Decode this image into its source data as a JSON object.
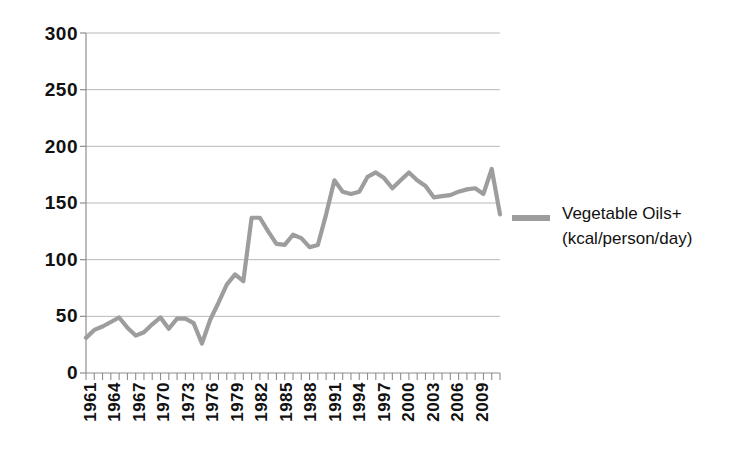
{
  "chart_data": {
    "type": "line",
    "title": "",
    "subtitle": "",
    "xlabel": "",
    "ylabel": "",
    "grid": true,
    "legend_position": "right",
    "xlim": [
      1961,
      2011
    ],
    "ylim": [
      0,
      300
    ],
    "y_ticks": [
      0,
      50,
      100,
      150,
      200,
      250,
      300
    ],
    "y_tick_labels": [
      "0",
      "50",
      "100",
      "150",
      "200",
      "250",
      "300"
    ],
    "x_tick_labels": [
      "1961",
      "1964",
      "1967",
      "1970",
      "1973",
      "1976",
      "1979",
      "1982",
      "1985",
      "1988",
      "1991",
      "1994",
      "1997",
      "2000",
      "2003",
      "2006",
      "2009"
    ],
    "x_tick_step": 3,
    "minor_x_ticks_every_year": true,
    "series": [
      {
        "name": "Vegetable Oils+ (kcal/person/day)",
        "color": "#9d9d9d",
        "x": [
          1961,
          1962,
          1963,
          1964,
          1965,
          1966,
          1967,
          1968,
          1969,
          1970,
          1971,
          1972,
          1973,
          1974,
          1975,
          1976,
          1977,
          1978,
          1979,
          1980,
          1981,
          1982,
          1983,
          1984,
          1985,
          1986,
          1987,
          1988,
          1989,
          1990,
          1991,
          1992,
          1993,
          1994,
          1995,
          1996,
          1997,
          1998,
          1999,
          2000,
          2001,
          2002,
          2003,
          2004,
          2005,
          2006,
          2007,
          2008,
          2009,
          2010,
          2011
        ],
        "values": [
          31,
          38,
          41,
          45,
          49,
          40,
          33,
          36,
          43,
          49,
          39,
          48,
          48,
          44,
          26,
          47,
          62,
          78,
          87,
          81,
          137,
          137,
          125,
          114,
          113,
          122,
          119,
          111,
          113,
          140,
          170,
          160,
          158,
          160,
          173,
          177,
          172,
          163,
          170,
          177,
          170,
          165,
          155,
          156,
          157,
          160,
          162,
          163,
          158,
          180,
          140
        ]
      }
    ]
  },
  "legend": {
    "line1": "Vegetable Oils+",
    "line2": "(kcal/person/day)",
    "marker_color": "#9d9d9d"
  },
  "colors": {
    "line": "#9d9d9d",
    "grid": "#b9b9b9",
    "axis": "#8e8e8e",
    "text": "#111111",
    "background": "#ffffff"
  }
}
